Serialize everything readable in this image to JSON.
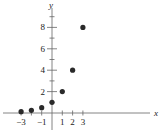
{
  "chart_data": {
    "type": "scatter",
    "title": "",
    "xlabel": "x",
    "ylabel": "y",
    "x": [
      -3,
      -2,
      -1,
      0,
      1,
      2,
      3
    ],
    "y": [
      0.125,
      0.25,
      0.5,
      1,
      2,
      4,
      8
    ],
    "x_ticks": [
      -3,
      -2,
      -1,
      0,
      1,
      2,
      3
    ],
    "x_tick_labels": [
      "−3",
      "",
      "−1",
      "",
      "1",
      "2",
      "3"
    ],
    "y_ticks": [
      1,
      2,
      3,
      4,
      5,
      6,
      7,
      8,
      9
    ],
    "y_tick_labels": {
      "2": "2",
      "4": "4",
      "6": "6",
      "8": "8"
    },
    "grid": false,
    "legend": null,
    "color": "#2a2a2a"
  }
}
